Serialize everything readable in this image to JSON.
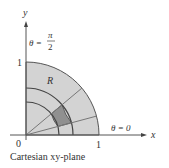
{
  "diagram": {
    "region_label": "R",
    "axis_x_label": "x",
    "axis_y_label": "y",
    "origin_label": "0",
    "x_tick_label": "1",
    "y_tick_label": "1",
    "theta_zero_label": "θ = 0",
    "theta_half_pi_prefix": "θ =",
    "theta_half_pi_num": "π",
    "theta_half_pi_den": "2",
    "caption": "Cartesian xy-plane",
    "colors": {
      "region_fill": "#d2d2d2",
      "sector_fill": "#8f8f8f",
      "lines": "#555555"
    }
  }
}
